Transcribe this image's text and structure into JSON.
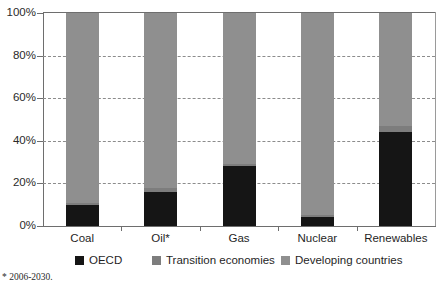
{
  "chart_data": {
    "type": "bar",
    "stacked": true,
    "stacked_normalized": true,
    "title": "",
    "subtitle": "",
    "xlabel": "",
    "ylabel": "",
    "categories": [
      "Coal",
      "Oil*",
      "Gas",
      "Nuclear",
      "Renewables"
    ],
    "series": [
      {
        "name": "OECD",
        "color": "#151515",
        "values": [
          10,
          16,
          28,
          4,
          44
        ]
      },
      {
        "name": "Transition economies",
        "color": "#7d7d7d",
        "values": [
          1,
          2,
          1,
          1,
          3
        ]
      },
      {
        "name": "Developing countries",
        "color": "#8f8f8f",
        "values": [
          89,
          82,
          71,
          95,
          53
        ]
      }
    ],
    "ylim": [
      0,
      100
    ],
    "yticks": [
      0,
      20,
      40,
      60,
      80,
      100
    ],
    "ytick_labels": [
      "0%",
      "20%",
      "40%",
      "60%",
      "80%",
      "100%"
    ],
    "grid": true,
    "grid_style": "dashed-horizontal",
    "legend_position": "bottom",
    "footnote": "* 2006-2030."
  },
  "axis": {
    "y_labels": [
      "100%",
      "80%",
      "60%",
      "40%",
      "20%",
      "0%"
    ],
    "x_labels": [
      "Coal",
      "Oil*",
      "Gas",
      "Nuclear",
      "Renewables"
    ]
  },
  "legend": {
    "items": [
      {
        "label": "OECD",
        "color": "#151515"
      },
      {
        "label": "Transition economies",
        "color": "#7d7d7d"
      },
      {
        "label": "Developing countries",
        "color": "#8f8f8f"
      }
    ]
  },
  "footnote": {
    "text": "* 2006-2030."
  }
}
